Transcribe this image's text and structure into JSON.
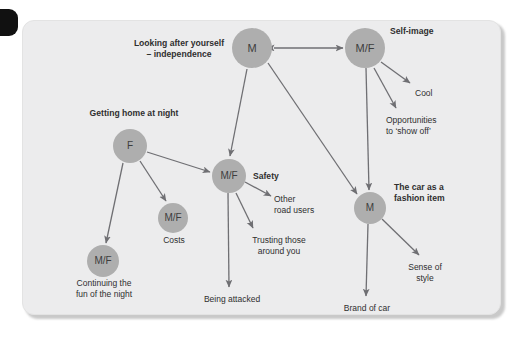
{
  "diagram": {
    "background": "#ececed",
    "node_fill": "#aeaeae",
    "node_text_color": "#3d3d3d",
    "line_color": "#6f6f73",
    "label_color": "#2f2f2f",
    "nodes": [
      {
        "id": "m-independence",
        "text": "M",
        "cx": 252,
        "cy": 48,
        "r": 20
      },
      {
        "id": "mf-selfimage",
        "text": "M/F",
        "cx": 365,
        "cy": 48,
        "r": 20
      },
      {
        "id": "f-gettinghome",
        "text": "F",
        "cx": 130,
        "cy": 146,
        "r": 17
      },
      {
        "id": "mf-safety",
        "text": "M/F",
        "cx": 229,
        "cy": 176,
        "r": 17
      },
      {
        "id": "mf-costs",
        "text": "M/F",
        "cx": 173,
        "cy": 218,
        "r": 15
      },
      {
        "id": "mf-continuing",
        "text": "M/F",
        "cx": 103,
        "cy": 261,
        "r": 16
      },
      {
        "id": "m-fashion",
        "text": "M",
        "cx": 370,
        "cy": 208,
        "r": 16
      }
    ],
    "labels": [
      {
        "id": "looking-after-yourself",
        "text": "Looking after yourself\n– independence",
        "bold": true,
        "align": "center",
        "x": 120,
        "y": 38,
        "w": 118
      },
      {
        "id": "self-image",
        "text": "Self-image",
        "bold": true,
        "align": "left",
        "x": 390,
        "y": 26,
        "w": 70
      },
      {
        "id": "cool",
        "text": "Cool",
        "bold": false,
        "align": "left",
        "x": 415,
        "y": 88,
        "w": 50
      },
      {
        "id": "opportunities",
        "text": "Opportunities\nto ‘show off’",
        "bold": false,
        "align": "left",
        "x": 386,
        "y": 115,
        "w": 80
      },
      {
        "id": "getting-home-at-night",
        "text": "Getting home at night",
        "bold": true,
        "align": "center",
        "x": 74,
        "y": 108,
        "w": 120
      },
      {
        "id": "safety",
        "text": "Safety",
        "bold": true,
        "align": "left",
        "x": 253,
        "y": 171,
        "w": 50
      },
      {
        "id": "other-road-users",
        "text": "Other\nroad users",
        "bold": false,
        "align": "left",
        "x": 274,
        "y": 194,
        "w": 62
      },
      {
        "id": "trusting-those",
        "text": "Trusting those\naround you",
        "bold": false,
        "align": "center",
        "x": 241,
        "y": 235,
        "w": 76
      },
      {
        "id": "being-attacked",
        "text": "Being attacked",
        "bold": false,
        "align": "center",
        "x": 193,
        "y": 294,
        "w": 78
      },
      {
        "id": "costs",
        "text": "Costs",
        "bold": false,
        "align": "center",
        "x": 152,
        "y": 235,
        "w": 44
      },
      {
        "id": "continuing-the-fun",
        "text": "Continuing the\nfun of the night",
        "bold": false,
        "align": "center",
        "x": 62,
        "y": 278,
        "w": 84
      },
      {
        "id": "car-as-fashion-item",
        "text": "The car as a\nfashion item",
        "bold": true,
        "align": "left",
        "x": 394,
        "y": 182,
        "w": 78
      },
      {
        "id": "sense-of-style",
        "text": "Sense of\nstyle",
        "bold": false,
        "align": "center",
        "x": 398,
        "y": 262,
        "w": 54
      },
      {
        "id": "brand-of-car",
        "text": "Brand of car",
        "bold": false,
        "align": "center",
        "x": 332,
        "y": 303,
        "w": 70
      }
    ],
    "edges": [
      {
        "id": "independence-to-selfimage",
        "from": "m-independence",
        "to": "mf-selfimage",
        "x1": 274,
        "y1": 48,
        "x2": 343,
        "y2": 48,
        "arrow": "both"
      },
      {
        "id": "independence-to-safety",
        "from": "m-independence",
        "to": "mf-safety",
        "x1": 247,
        "y1": 69,
        "x2": 230,
        "y2": 156,
        "arrow": "end"
      },
      {
        "id": "independence-to-fashion",
        "from": "m-independence",
        "to": "m-fashion",
        "x1": 268,
        "y1": 63,
        "x2": 357,
        "y2": 194,
        "arrow": "end"
      },
      {
        "id": "selfimage-to-cool",
        "from": "mf-selfimage",
        "to": "cool",
        "x1": 381,
        "y1": 62,
        "x2": 410,
        "y2": 83,
        "arrow": "end"
      },
      {
        "id": "selfimage-to-opportunities",
        "from": "mf-selfimage",
        "to": "opportunities",
        "x1": 374,
        "y1": 68,
        "x2": 396,
        "y2": 108,
        "arrow": "end"
      },
      {
        "id": "selfimage-to-fashion",
        "from": "mf-selfimage",
        "to": "m-fashion",
        "x1": 366,
        "y1": 68,
        "x2": 369,
        "y2": 190,
        "arrow": "end"
      },
      {
        "id": "gettinghome-to-safety",
        "from": "f-gettinghome",
        "to": "mf-safety",
        "x1": 147,
        "y1": 152,
        "x2": 210,
        "y2": 172,
        "arrow": "end"
      },
      {
        "id": "gettinghome-to-costs",
        "from": "f-gettinghome",
        "to": "mf-costs",
        "x1": 140,
        "y1": 161,
        "x2": 166,
        "y2": 201,
        "arrow": "end"
      },
      {
        "id": "gettinghome-to-continuing",
        "from": "f-gettinghome",
        "to": "mf-continuing",
        "x1": 123,
        "y1": 163,
        "x2": 106,
        "y2": 243,
        "arrow": "end"
      },
      {
        "id": "safety-to-otherroadusers",
        "from": "mf-safety",
        "to": "other-road-users",
        "x1": 245,
        "y1": 182,
        "x2": 271,
        "y2": 196,
        "arrow": "end"
      },
      {
        "id": "safety-to-trusting",
        "from": "mf-safety",
        "to": "trusting-those",
        "x1": 236,
        "y1": 193,
        "x2": 253,
        "y2": 228,
        "arrow": "end"
      },
      {
        "id": "safety-to-beingattacked",
        "from": "mf-safety",
        "to": "being-attacked",
        "x1": 228,
        "y1": 193,
        "x2": 229,
        "y2": 287,
        "arrow": "end"
      },
      {
        "id": "fashion-to-brandofcar",
        "from": "m-fashion",
        "to": "brand-of-car",
        "x1": 368,
        "y1": 224,
        "x2": 366,
        "y2": 296,
        "arrow": "end"
      },
      {
        "id": "fashion-to-senseofstyle",
        "from": "m-fashion",
        "to": "sense-of-style",
        "x1": 382,
        "y1": 219,
        "x2": 419,
        "y2": 255,
        "arrow": "end"
      }
    ]
  }
}
